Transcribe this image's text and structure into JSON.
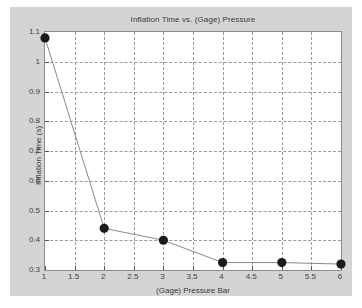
{
  "chart_data": {
    "type": "line",
    "title": "Inflation Time vs. (Gage) Pressure",
    "xlabel": "(Gage) Pressure  Bar",
    "ylabel": "Inflation Time (s)",
    "x": [
      1,
      2,
      3,
      4,
      5,
      6
    ],
    "values": [
      1.08,
      0.44,
      0.4,
      0.325,
      0.325,
      0.32
    ],
    "series": [
      {
        "name": "Inflation Time",
        "x": [
          1,
          2,
          3,
          4,
          5,
          6
        ],
        "values": [
          1.08,
          0.44,
          0.4,
          0.325,
          0.325,
          0.32
        ]
      }
    ],
    "xlim": [
      1,
      6
    ],
    "ylim": [
      0.3,
      1.1
    ],
    "xticks": [
      1,
      1.5,
      2,
      2.5,
      3,
      3.5,
      4,
      4.5,
      5,
      5.5,
      6
    ],
    "xtick_labels": [
      "1",
      "1.5",
      "2",
      "2.5",
      "3",
      "3.5",
      "4",
      "4.5",
      "5",
      "5.5",
      "6"
    ],
    "yticks": [
      0.3,
      0.4,
      0.5,
      0.6,
      0.7,
      0.8,
      0.9,
      1.0,
      1.1
    ],
    "ytick_labels": [
      "0.3",
      "0.4",
      "0.5",
      "0.6",
      "0.7",
      "0.8",
      "0.9",
      "1",
      "1.1"
    ],
    "grid": true,
    "legend": false,
    "marker": "filled-circle",
    "marker_color": "#1a1a1a",
    "line_color": "#8a8a8a",
    "figure_background": "#d4d4d4",
    "axes_background": "#ffffff",
    "grid_color": "#9a9a9a"
  }
}
